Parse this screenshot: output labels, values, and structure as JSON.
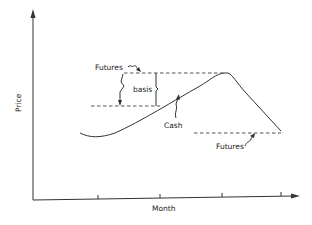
{
  "diagram": {
    "type": "futures-cash-basis-price-chart",
    "axes": {
      "y_label": "Price",
      "x_label": "Month",
      "x_ticks": 4
    },
    "labels": {
      "futures_top": "Futures",
      "basis": "basis",
      "cash": "Cash",
      "futures_bottom": "Futures"
    },
    "colors": {
      "line": "#333333",
      "background": "#ffffff"
    }
  }
}
